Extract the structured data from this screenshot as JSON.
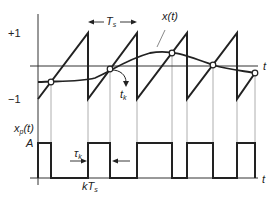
{
  "diagram": {
    "top_plot": {
      "y_tick_plus": "+1",
      "y_tick_minus": "−1",
      "t_axis_label": "t",
      "period_label": "T",
      "period_sub": "s",
      "signal_label": "x(t)",
      "crossing_label": "t",
      "crossing_sub": "k"
    },
    "bottom_plot": {
      "y_label": "x",
      "y_label_sub": "p",
      "y_label_arg": "(t)",
      "amplitude_label": "A",
      "tau_label": "τ",
      "tau_sub": "k",
      "kTs_label_k": "kT",
      "kTs_sub": "s",
      "t_axis_label": "t"
    },
    "colors": {
      "line": "#222222",
      "guide": "#999999"
    }
  }
}
